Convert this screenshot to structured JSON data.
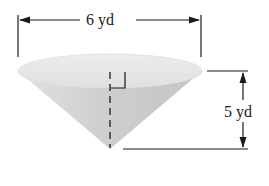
{
  "figure": {
    "type": "cone",
    "dimensions": {
      "diameter": {
        "value": 6,
        "unit": "yd",
        "label": "6 yd"
      },
      "height": {
        "value": 5,
        "unit": "yd",
        "label": "5 yd"
      }
    },
    "annotations": {
      "right_angle_marker": true,
      "axis_style": "dashed"
    },
    "colors": {
      "stroke": "#1a1a1a",
      "cone_top": "#e6e6e6",
      "cone_body_light": "#d2d2d2",
      "cone_body_dark": "#bdbdbd",
      "background": "#ffffff"
    }
  }
}
